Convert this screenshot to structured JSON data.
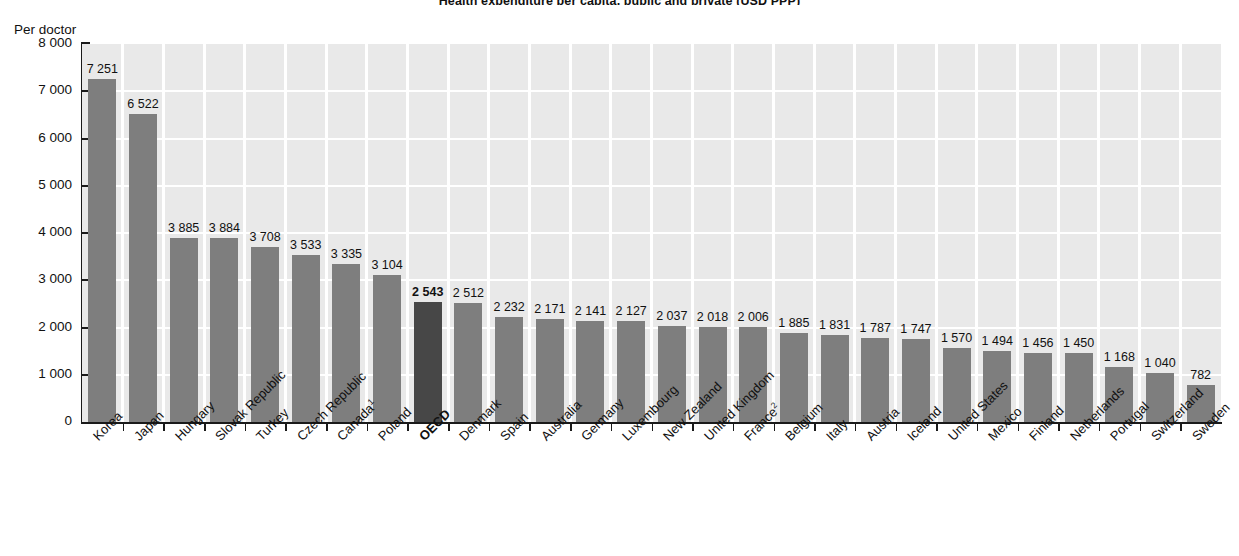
{
  "figure": {
    "title": "Health expenditure per capita, public and private (USD PPP)",
    "unit_label": "Per doctor"
  },
  "chart_data": {
    "type": "bar",
    "title": "Health expenditure per capita, public and private (USD PPP)",
    "xlabel": "",
    "ylabel": "Per doctor",
    "ylim": [
      0,
      8000
    ],
    "ytick_values": [
      0,
      1000,
      2000,
      3000,
      4000,
      5000,
      6000,
      7000,
      8000
    ],
    "ytick_labels": [
      "0",
      "1 000",
      "2 000",
      "3 000",
      "4 000",
      "5 000",
      "6 000",
      "7 000",
      "8 000"
    ],
    "grid": "both",
    "legend": "none",
    "highlight_category": "OECD",
    "highlight_color": "#474747",
    "bar_color": "#7e7e7e",
    "plot_background": "#e9e9e9",
    "gridline_color": "#ffffff",
    "categories": [
      "Korea",
      "Japan",
      "Hungary",
      "Slovak Republic",
      "Turkey",
      "Czech Republic",
      "Canada",
      "Poland",
      "OECD",
      "Denmark",
      "Spain",
      "Australia",
      "Germany",
      "Luxembourg",
      "New Zealand",
      "United Kingdom",
      "France",
      "Belgium",
      "Italy",
      "Austria",
      "Iceland",
      "United States",
      "Mexico",
      "Finland",
      "Netherlands",
      "Portugal",
      "Switzerland",
      "Sweden"
    ],
    "category_footnotes": {
      "Canada": "1",
      "France": "2"
    },
    "values": [
      7251,
      6522,
      3885,
      3884,
      3708,
      3533,
      3335,
      3104,
      2543,
      2512,
      2232,
      2171,
      2141,
      2127,
      2037,
      2018,
      2006,
      1885,
      1831,
      1787,
      1747,
      1570,
      1494,
      1456,
      1450,
      1168,
      1040,
      782
    ],
    "value_labels": [
      "7 251",
      "6 522",
      "3 885",
      "3 884",
      "3 708",
      "3 533",
      "3 335",
      "3 104",
      "2 543",
      "2 512",
      "2 232",
      "2 171",
      "2 141",
      "2 127",
      "2 037",
      "2 018",
      "2 006",
      "1 885",
      "1 831",
      "1 787",
      "1 747",
      "1 570",
      "1 494",
      "1 456",
      "1 450",
      "1 168",
      "1 040",
      "782"
    ]
  }
}
